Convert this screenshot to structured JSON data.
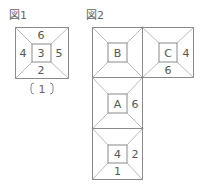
{
  "figure1": {
    "title": "図1",
    "faces": {
      "center": "3",
      "top": "6",
      "left": "4",
      "right": "5",
      "bottom": "2"
    },
    "caption": "(1)"
  },
  "figure2": {
    "title": "図2",
    "squares": [
      {
        "id": "square-b",
        "center": "B",
        "top": "",
        "left": "",
        "right": "",
        "bottom": ""
      },
      {
        "id": "square-c",
        "center": "C",
        "top": "",
        "left": "",
        "right": "4",
        "bottom": "6"
      },
      {
        "id": "square-a",
        "center": "A",
        "top": "",
        "left": "",
        "right": "6",
        "bottom": ""
      },
      {
        "id": "square-bottom",
        "center": "4",
        "top": "",
        "left": "",
        "right": "2",
        "bottom": "1"
      }
    ]
  },
  "colors": {
    "line": "#8a8a8a",
    "text": "#555555",
    "background": "#ffffff"
  }
}
